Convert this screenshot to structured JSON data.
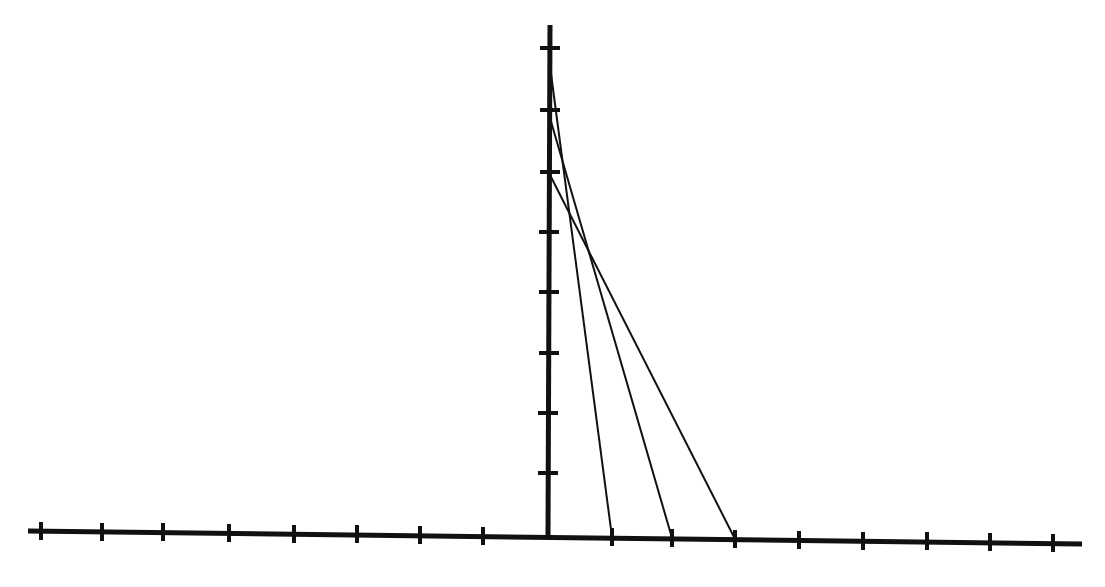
{
  "diagram": {
    "type": "coordinate-axes-with-segments",
    "colors": {
      "background": "#ffffff",
      "ink": "#111111"
    },
    "origin": {
      "x": 548,
      "y": 535
    },
    "x_axis": {
      "x_start": 28,
      "y_start": 531,
      "x_end": 1082,
      "y_end": 544,
      "stroke_width": 5,
      "ticks": [
        {
          "x": 41,
          "y": 531
        },
        {
          "x": 102,
          "y": 532
        },
        {
          "x": 163,
          "y": 532
        },
        {
          "x": 229,
          "y": 533
        },
        {
          "x": 294,
          "y": 534
        },
        {
          "x": 357,
          "y": 534
        },
        {
          "x": 420,
          "y": 535
        },
        {
          "x": 483,
          "y": 536
        },
        {
          "x": 612,
          "y": 537
        },
        {
          "x": 672,
          "y": 538
        },
        {
          "x": 735,
          "y": 539
        },
        {
          "x": 799,
          "y": 540
        },
        {
          "x": 863,
          "y": 541
        },
        {
          "x": 927,
          "y": 541
        },
        {
          "x": 990,
          "y": 542
        },
        {
          "x": 1053,
          "y": 543
        }
      ],
      "tick_half_length": 9
    },
    "y_axis": {
      "x_top": 550,
      "y_top": 25,
      "x_bottom": 548,
      "y_bottom": 535,
      "stroke_width": 5,
      "ticks": [
        {
          "x": 550,
          "y": 48
        },
        {
          "x": 550,
          "y": 110
        },
        {
          "x": 550,
          "y": 172
        },
        {
          "x": 549,
          "y": 232
        },
        {
          "x": 549,
          "y": 292
        },
        {
          "x": 549,
          "y": 353
        },
        {
          "x": 548,
          "y": 413
        },
        {
          "x": 548,
          "y": 473
        }
      ],
      "tick_half_length": 10
    },
    "segments": [
      {
        "name": "segment-1",
        "x1": 550,
        "y1": 66,
        "x2": 612,
        "y2": 537
      },
      {
        "name": "segment-2",
        "x1": 550,
        "y1": 118,
        "x2": 672,
        "y2": 538
      },
      {
        "name": "segment-3",
        "x1": 550,
        "y1": 175,
        "x2": 735,
        "y2": 539
      }
    ],
    "segment_stroke_width": 2
  }
}
